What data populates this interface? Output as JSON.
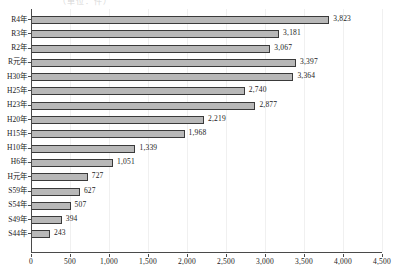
{
  "top_crop_ghost": "（単位：件）",
  "chart_data": {
    "type": "bar",
    "orientation": "horizontal",
    "title": "",
    "subtitle": "",
    "xlabel": "",
    "ylabel": "",
    "categories": [
      "R4年",
      "R3年",
      "R2年",
      "R元年",
      "H30年",
      "H25年",
      "H23年",
      "H20年",
      "H15年",
      "H10年",
      "H6年",
      "H元年",
      "S59年",
      "S54年",
      "S49年",
      "S44年"
    ],
    "values": [
      3823,
      3181,
      3067,
      3397,
      3364,
      2740,
      2877,
      2219,
      1968,
      1339,
      1051,
      727,
      627,
      507,
      394,
      243
    ],
    "value_labels": [
      "3,823",
      "3,181",
      "3,067",
      "3,397",
      "3,364",
      "2,740",
      "2,877",
      "2,219",
      "1,968",
      "1,339",
      "1,051",
      "727",
      "627",
      "507",
      "394",
      "243"
    ],
    "xlim": [
      0,
      4500
    ],
    "xticks": [
      0,
      500,
      1000,
      1500,
      2000,
      2500,
      3000,
      3500,
      4000,
      4500
    ],
    "xtick_labels": [
      "0",
      "500",
      "1,000",
      "1,500",
      "2,000",
      "2,500",
      "3,000",
      "3,500",
      "4,000",
      "4,500"
    ],
    "grid": true,
    "legend": null,
    "bar_fill_color": "#b8b8b8",
    "bar_edge_color": "#3a3a3a",
    "axis_color": "#4a4a4a",
    "gridline_color": "#f0f0f0"
  }
}
